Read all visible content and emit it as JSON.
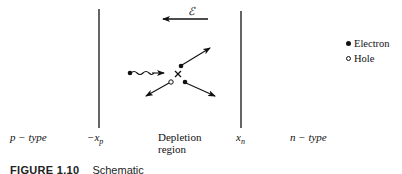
{
  "diagram": {
    "field_label": "ℰ",
    "boundaries": {
      "left": {
        "label": "−x",
        "subscript": "p"
      },
      "right": {
        "label": "x",
        "subscript": "n"
      }
    },
    "regions": {
      "left": "p − type",
      "middle_line1": "Depletion",
      "middle_line2": "region",
      "right": "n − type"
    },
    "legend": [
      {
        "symbol": "filled-circle",
        "label": "Electron"
      },
      {
        "symbol": "open-circle",
        "label": "Hole"
      }
    ],
    "colors": {
      "ink": "#111111",
      "background": "#ffffff"
    }
  },
  "caption": {
    "number": "FIGURE 1.10",
    "text": "Schematic"
  }
}
